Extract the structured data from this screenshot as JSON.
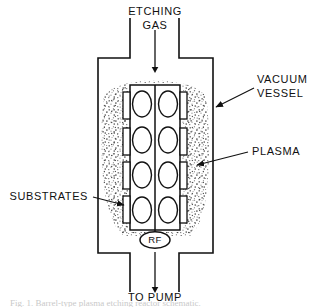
{
  "figure": {
    "type": "schematic-diagram",
    "background_color": "#ffffff",
    "line_color": "#111111",
    "stipple_color": "#555555"
  },
  "labels": {
    "inlet_line1": "ETCHING",
    "inlet_line2": "GAS",
    "vacuum_vessel_line1": "VACUUM",
    "vacuum_vessel_line2": "VESSEL",
    "plasma": "PLASMA",
    "substrates": "SUBSTRATES",
    "rf": "RF",
    "outlet": "TO  PUMP"
  },
  "icons": {
    "inlet_arrow": "arrow-down-icon",
    "outlet_arrow": "arrow-down-icon",
    "vessel_leader_arrow": "leader-arrow-icon",
    "plasma_leader_arrow": "leader-arrow-icon",
    "substrates_leader_arrow": "leader-arrow-icon"
  },
  "geometry": {
    "vessel": {
      "left_wall_x": 98,
      "right_wall_x": 213,
      "top_y": 58,
      "bottom_y": 253,
      "neck_left_x": 130,
      "neck_right_x": 179,
      "neck_top_y": 18,
      "neck_bottom_y": 292
    },
    "rack": {
      "left_x": 130,
      "right_x": 180,
      "top_y": 85,
      "bottom_y": 230,
      "center_x": 155,
      "columns": 2,
      "rows": 4,
      "wafer_count": 8,
      "tab_pairs": 4
    },
    "rf_ellipse": {
      "cx": 155,
      "cy": 240,
      "rx": 15,
      "ry": 8
    }
  },
  "caption_ghost": "Fig. 1.  Barrel-type plasma etching reactor schematic."
}
